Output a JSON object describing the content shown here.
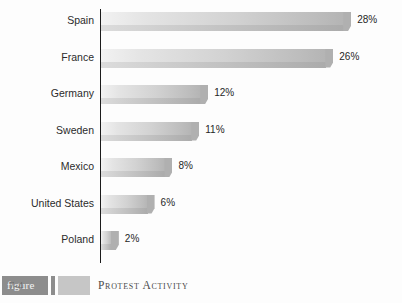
{
  "chart_data": {
    "type": "bar",
    "orientation": "horizontal",
    "title": "",
    "xlabel": "",
    "ylabel": "",
    "grid": false,
    "legend": false,
    "xlim": [
      0,
      30
    ],
    "categories": [
      "Spain",
      "France",
      "Germany",
      "Sweden",
      "Mexico",
      "United States",
      "Poland"
    ],
    "values": [
      28,
      26,
      12,
      11,
      8,
      6,
      2
    ],
    "value_labels": [
      "28%",
      "26%",
      "12%",
      "11%",
      "8%",
      "6%",
      "2%"
    ],
    "bars": [
      {
        "category": "Spain",
        "value": 28,
        "label": "28%"
      },
      {
        "category": "France",
        "value": 26,
        "label": "26%"
      },
      {
        "category": "Germany",
        "value": 12,
        "label": "12%"
      },
      {
        "category": "Sweden",
        "value": 11,
        "label": "11%"
      },
      {
        "category": "Mexico",
        "value": 8,
        "label": "8%"
      },
      {
        "category": "United States",
        "value": 6,
        "label": "6%"
      },
      {
        "category": "Poland",
        "value": 2,
        "label": "2%"
      }
    ]
  },
  "caption": {
    "figure_word": "figure",
    "figure_number": "7-4",
    "figure_title": "Protest Activity"
  },
  "title_remnant": "",
  "colors": {
    "bar_light": "#f2f2f2",
    "bar_dark": "#b0b0b0",
    "axis": "#1c1c1c",
    "text": "#2b2b2b",
    "caption_dark_box": "#8d8d8d",
    "caption_light_box": "#c6c6c6",
    "background": "#fdfdfd"
  }
}
